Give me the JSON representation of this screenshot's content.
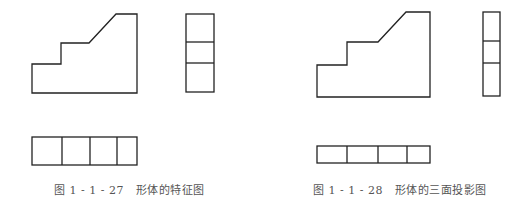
{
  "figures": [
    {
      "id": "left",
      "caption": "图 1 - 1 - 27   形体的特征图",
      "front_view": {
        "points": [
          [
            32,
            93
          ],
          [
            32,
            64
          ],
          [
            61,
            64
          ],
          [
            61,
            43
          ],
          [
            89,
            43
          ],
          [
            116,
            14
          ],
          [
            137,
            14
          ],
          [
            137,
            93
          ]
        ]
      },
      "side_view": {
        "x": 186,
        "y": 14,
        "width": 28,
        "height": 78,
        "dividers_y": [
          42,
          63
        ]
      },
      "top_view": {
        "x": 32,
        "y": 137,
        "width": 105,
        "height": 28,
        "dividers_x": [
          62,
          90,
          117
        ]
      }
    },
    {
      "id": "right",
      "caption": "图 1 - 1 - 28   形体的三面投影图",
      "front_view": {
        "points": [
          [
            317,
            97
          ],
          [
            317,
            65
          ],
          [
            347,
            65
          ],
          [
            347,
            42
          ],
          [
            378,
            42
          ],
          [
            406,
            12
          ],
          [
            430,
            12
          ],
          [
            430,
            97
          ]
        ]
      },
      "side_view": {
        "x": 483,
        "y": 12,
        "width": 17,
        "height": 84,
        "dividers_y": [
          41,
          63
        ]
      },
      "top_view": {
        "x": 317,
        "y": 146,
        "width": 113,
        "height": 17,
        "dividers_x": [
          347,
          378,
          407
        ]
      }
    }
  ],
  "colors": {
    "line": "#222222",
    "caption": "#555555",
    "background": "#ffffff"
  }
}
